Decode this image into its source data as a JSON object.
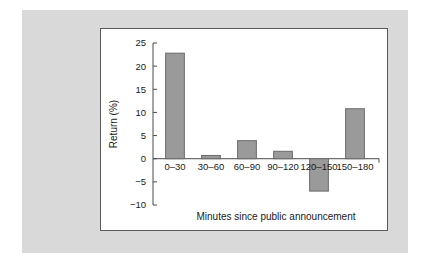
{
  "chart_data": {
    "type": "bar",
    "title": "",
    "subtitle": "",
    "xlabel": "Minutes since public announcement",
    "ylabel": "Return (%)",
    "categories": [
      "0–30",
      "30–60",
      "60–90",
      "90–120",
      "120–150",
      "150–180"
    ],
    "values": [
      22.8,
      0.7,
      3.9,
      1.6,
      -7.0,
      10.8
    ],
    "ylim": [
      -10,
      25
    ],
    "yticks": [
      25,
      20,
      15,
      10,
      5,
      0,
      -5,
      -10
    ],
    "ytick_labels": [
      "25",
      "20",
      "15",
      "10",
      "5",
      "0",
      "−5",
      "−10"
    ],
    "grid": false,
    "legend": false,
    "legend_position": "none",
    "bar_color": "#9a9a9a",
    "bar_edge_color": "#6b6b6b",
    "axis_color": "#4a4a4a",
    "panel_background": "#ffffff",
    "page_background": "#d9d9d9"
  }
}
